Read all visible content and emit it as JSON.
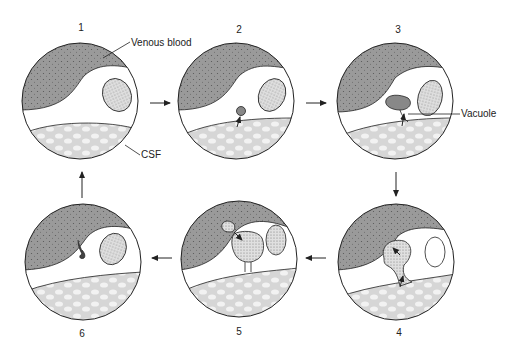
{
  "diagram": {
    "type": "process-cycle",
    "stages": [
      {
        "id": "1",
        "label": "1",
        "cx": 80,
        "cy": 101
      },
      {
        "id": "2",
        "label": "2",
        "cx": 236,
        "cy": 101
      },
      {
        "id": "3",
        "label": "3",
        "cx": 395,
        "cy": 101
      },
      {
        "id": "4",
        "label": "4",
        "cx": 396,
        "cy": 262
      },
      {
        "id": "5",
        "label": "5",
        "cx": 239,
        "cy": 259
      },
      {
        "id": "6",
        "label": "6",
        "cx": 83,
        "cy": 262
      }
    ],
    "flow": [
      "1",
      "2",
      "3",
      "4",
      "5",
      "6",
      "1"
    ],
    "labels": {
      "venous_blood": "Venous blood",
      "csf": "CSF",
      "vacuole": "Vacuole"
    },
    "colors": {
      "venous_blood": "#9a9a9a",
      "csf": "#e2e2e2",
      "cell_body": "#cfcfcf",
      "outline": "#222222",
      "background": "#ffffff"
    }
  }
}
